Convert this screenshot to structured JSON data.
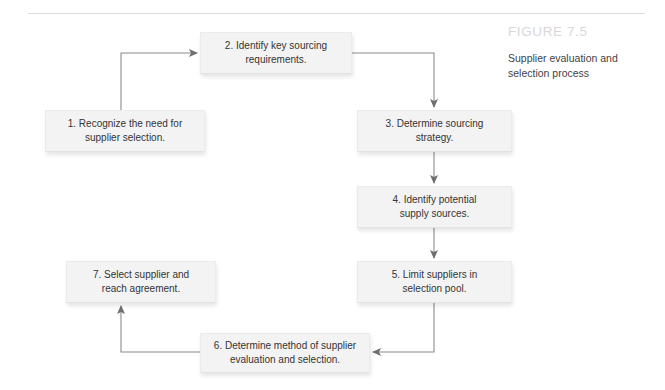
{
  "figure": {
    "number": "FIGURE 7.5",
    "caption": "Supplier evaluation and\nselection process"
  },
  "diagram": {
    "type": "flowchart",
    "nodes": [
      {
        "id": "1",
        "label": "1.  Recognize the need for\nsupplier selection."
      },
      {
        "id": "2",
        "label": "2. Identify key sourcing\nrequirements."
      },
      {
        "id": "3",
        "label": "3. Determine sourcing\nstrategy."
      },
      {
        "id": "4",
        "label": "4. Identify potential\nsupply sources."
      },
      {
        "id": "5",
        "label": "5. Limit suppliers in\nselection pool."
      },
      {
        "id": "6",
        "label": "6. Determine method of supplier\nevaluation and selection."
      },
      {
        "id": "7",
        "label": "7. Select supplier and\nreach agreement."
      }
    ],
    "edges": [
      {
        "from": "1",
        "to": "2",
        "direction": "up-then-right"
      },
      {
        "from": "2",
        "to": "3",
        "direction": "right-then-down"
      },
      {
        "from": "3",
        "to": "4",
        "direction": "down"
      },
      {
        "from": "4",
        "to": "5",
        "direction": "down"
      },
      {
        "from": "5",
        "to": "6",
        "direction": "down-then-left"
      },
      {
        "from": "6",
        "to": "7",
        "direction": "left-then-up"
      }
    ]
  },
  "colors": {
    "node_fill": "#f3f3f3",
    "node_border": "#ebebeb",
    "connector": "#808080",
    "figure_number": "#d8d8d8",
    "text": "#333333",
    "rule": "#dcdcdc"
  }
}
